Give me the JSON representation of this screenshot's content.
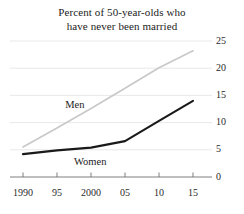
{
  "chart_data": {
    "type": "line",
    "title": "Percent of 50-year-olds who have never been married",
    "title_lines": [
      "Percent of 50-year-olds who",
      "have never been married"
    ],
    "xlabel": "",
    "ylabel": "",
    "x": [
      1990,
      1995,
      2000,
      2005,
      2010,
      2015
    ],
    "xtick_labels": [
      "1990",
      "95",
      "2000",
      "05",
      "10",
      "15"
    ],
    "ytick_labels": [
      "0",
      "5",
      "10",
      "15",
      "20",
      "25"
    ],
    "ytick_values": [
      0,
      5,
      10,
      15,
      20,
      25
    ],
    "ylim": [
      0,
      26.5
    ],
    "xlim": [
      1990,
      2015
    ],
    "grid": true,
    "grid_axis": "y",
    "legend": "inline-annotations",
    "series": [
      {
        "name": "Men",
        "color": "#c9c9c9",
        "values": [
          5.5,
          9.0,
          12.6,
          16.3,
          20.1,
          23.2
        ],
        "label_x": 1996.2,
        "label_y": 13.0
      },
      {
        "name": "Women",
        "color": "#1a1a1a",
        "values": [
          4.2,
          4.9,
          5.4,
          6.6,
          10.3,
          14.0
        ],
        "label_x": 1997.5,
        "label_y": 2.6
      }
    ]
  },
  "axis": {
    "tick_color": "#6f6f6f",
    "grid_color": "#e2e2e2",
    "axis_line_color": "#6f6f6f"
  }
}
